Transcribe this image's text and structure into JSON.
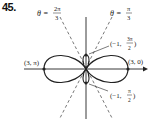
{
  "problem_number": "45.",
  "diagram": {
    "type": "polar-curve",
    "axes": {
      "horizontal_arrow": true,
      "vertical": true
    },
    "lines": [
      {
        "label_theta": "θ =",
        "label_num": "2π",
        "label_den": "3",
        "style": "dashed"
      },
      {
        "label_theta": "θ =",
        "label_num": "π",
        "label_den": "3",
        "style": "dashed"
      }
    ],
    "points": [
      {
        "label": "(3, π)"
      },
      {
        "label": "(3, 0)"
      },
      {
        "label_prefix": "(−1,",
        "label_num": "3π",
        "label_den": "2",
        "label_suffix": ")"
      },
      {
        "label_prefix": "(−1,",
        "label_num": "π",
        "label_den": "2",
        "label_suffix": ")"
      }
    ],
    "colors": {
      "ink": "#222222",
      "dash": "#555555",
      "background": "#ffffff"
    }
  }
}
